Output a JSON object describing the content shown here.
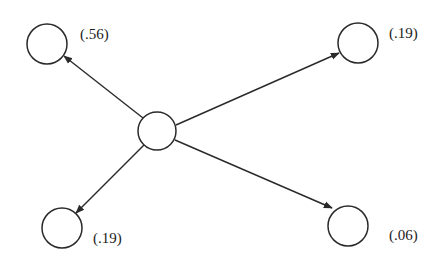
{
  "diagram": {
    "type": "tree",
    "center_node": {
      "id": "root"
    },
    "children": [
      {
        "id": "top-left",
        "label": "(.56)",
        "value": 0.56
      },
      {
        "id": "top-right",
        "label": "(.19)",
        "value": 0.19
      },
      {
        "id": "bottom-left",
        "label": "(.19)",
        "value": 0.19
      },
      {
        "id": "bottom-right",
        "label": "(.06)",
        "value": 0.06
      }
    ],
    "colors": {
      "stroke": "#2a2a2a",
      "background": "#ffffff",
      "text": "#222222"
    }
  }
}
